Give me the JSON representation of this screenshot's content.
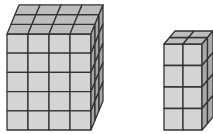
{
  "figure": {
    "colors": {
      "front": "#d4d4d4",
      "top": "#bdbdbd",
      "side": "#a8a8a8",
      "edge": "#333333",
      "background": "#ffffff"
    },
    "prisms": [
      {
        "label": "large-prism",
        "width": 4,
        "height": 5,
        "depth": 3
      },
      {
        "label": "small-prism",
        "width": 2,
        "height": 4,
        "depth": 2
      }
    ]
  }
}
